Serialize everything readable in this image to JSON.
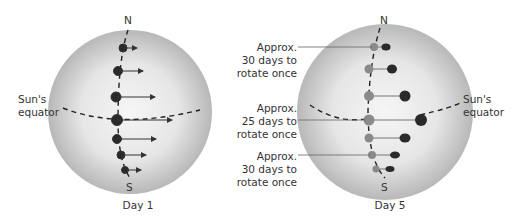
{
  "diagrams": [
    {
      "caption": "Day 1",
      "north": "N",
      "south": "S",
      "equator_label": [
        "Sun's",
        "equator"
      ]
    },
    {
      "caption": "Day 5",
      "north": "N",
      "south": "S",
      "equator_label": [
        "Sun's",
        "equator"
      ],
      "annotations": [
        {
          "line1": "Approx.",
          "line2": "30 days to",
          "line3": "rotate once"
        },
        {
          "line1": "Approx.",
          "line2": "25 days to",
          "line3": "rotate once"
        },
        {
          "line1": "Approx.",
          "line2": "30 days to",
          "line3": "rotate once"
        }
      ]
    }
  ],
  "colors": {
    "spot_dark": "#2a2a2a",
    "spot_faded": "#8a8a8a",
    "sphere_edge": "#b8b8b8",
    "sphere_center": "#f4f4f4"
  }
}
